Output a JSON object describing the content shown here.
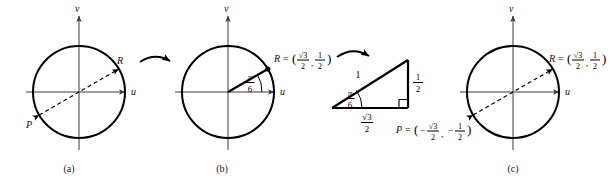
{
  "figure": {
    "caption_labels": {
      "a": "(a)",
      "b": "(b)",
      "c": "(c)"
    },
    "axes": {
      "horizontal_label": "u",
      "vertical_label": "v"
    },
    "panel_a": {
      "point_R_label": "R",
      "point_P_label": "P"
    },
    "panel_b": {
      "point_R_label": "R",
      "equals": "=",
      "open_paren": "(",
      "close_paren": ")",
      "comma": ",",
      "R_x_numerator": "√3",
      "R_x_denominator": "2",
      "R_y_numerator": "1",
      "R_y_denominator": "2",
      "angle_numerator": "π",
      "angle_denominator": "6"
    },
    "triangle": {
      "hypotenuse_label": "1",
      "vertical_numerator": "1",
      "vertical_denominator": "2",
      "base_numerator": "√3",
      "base_denominator": "2",
      "angle_numerator": "π",
      "angle_denominator": "6"
    },
    "panel_c": {
      "point_R_label": "R",
      "equals": "=",
      "open_paren": "(",
      "close_paren": ")",
      "comma": ",",
      "R_x_numerator": "√3",
      "R_x_denominator": "2",
      "R_y_numerator": "1",
      "R_y_denominator": "2",
      "point_P_label": "P",
      "P_minus_x": "−",
      "P_x_numerator": "√3",
      "P_x_denominator": "2",
      "P_minus_y": "−",
      "P_y_numerator": "1",
      "P_y_denominator": "2"
    },
    "colors": {
      "stroke": "#000000",
      "axis": "#3a3a3a",
      "background": "#ffffff"
    }
  }
}
